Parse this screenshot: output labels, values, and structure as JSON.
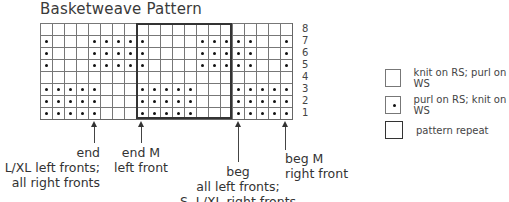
{
  "title": "Basketweave Pattern",
  "chart": {
    "columns": 21,
    "rows_top_to_bottom": [
      {
        "row": "8",
        "cells": "kkkkkkkkkkkkkkkkkkkkk"
      },
      {
        "row": "7",
        "cells": "pkkkpppppkkkkpppppkkp"
      },
      {
        "row": "6",
        "cells": "pkkkpppppkkkkpppppkkp"
      },
      {
        "row": "5",
        "cells": "pkkkpppppkkkkpppppkkp"
      },
      {
        "row": "4",
        "cells": "kkkkkkkkkkkkkkkkkkkkk"
      },
      {
        "row": "3",
        "cells": "pppppkkkpppppkkkppppp"
      },
      {
        "row": "2",
        "cells": "pppppkkkpppppkkkppppp"
      },
      {
        "row": "1",
        "cells": "pppppkkkpppppkkkppppp"
      }
    ],
    "pattern_repeat": {
      "start_col": 9,
      "end_col": 16
    }
  },
  "row_numbers": [
    "8",
    "7",
    "6",
    "5",
    "4",
    "3",
    "2",
    "1"
  ],
  "annotations": {
    "end_small": {
      "line1": "end",
      "line2": "S, L/XL left fronts;",
      "line3": "all right fronts"
    },
    "end_m": {
      "line1": "end M",
      "line2": "left front"
    },
    "beg_all": {
      "line1": "beg",
      "line2": "all left fronts;",
      "line3": "S, L/XL right fronts"
    },
    "beg_m": {
      "line1": "beg M",
      "line2": "right front"
    }
  },
  "legend": [
    {
      "symbol": "blank-square",
      "label": "knit on RS; purl on WS"
    },
    {
      "symbol": "dot-square",
      "label": "purl on RS; knit on WS"
    },
    {
      "symbol": "bold-square",
      "label": "pattern repeat"
    }
  ]
}
